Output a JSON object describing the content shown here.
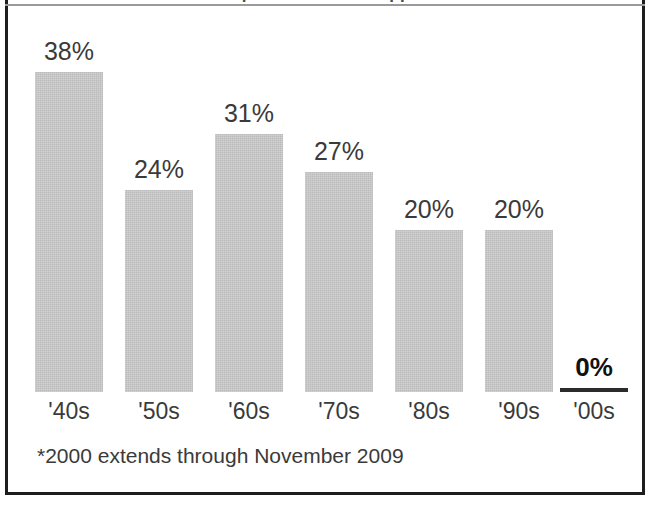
{
  "figure": {
    "title_clipped": "...top of chart title cropped...",
    "footnote": "*2000 extends through November 2009",
    "frame_color": "#1d1d1d",
    "bar_color": "#bcbcbc",
    "label_color": "#3a3a3a"
  },
  "chart_data": {
    "type": "bar",
    "title": "",
    "xlabel": "",
    "ylabel": "",
    "grid": false,
    "legend": "none",
    "ylim": [
      0,
      40
    ],
    "categories": [
      "'40s",
      "'50s",
      "'60s",
      "'70s",
      "'80s",
      "'90s",
      "'00s"
    ],
    "values": [
      38,
      24,
      31,
      27,
      20,
      20,
      0
    ],
    "data_labels": [
      "38%",
      "24%",
      "31%",
      "27%",
      "20%",
      "20%",
      "0%"
    ],
    "emphasis_index": 6,
    "annotations": [
      "*2000 extends through November 2009"
    ]
  },
  "bars": [
    {
      "label": "'40s",
      "value_label": "38%",
      "value": 38,
      "left": 35,
      "height": 320,
      "bold": false,
      "zero": false
    },
    {
      "label": "'50s",
      "value_label": "24%",
      "value": 24,
      "left": 125,
      "height": 202,
      "bold": false,
      "zero": false
    },
    {
      "label": "'60s",
      "value_label": "31%",
      "value": 31,
      "left": 215,
      "height": 258,
      "bold": false,
      "zero": false
    },
    {
      "label": "'70s",
      "value_label": "27%",
      "value": 27,
      "left": 305,
      "height": 220,
      "bold": false,
      "zero": false
    },
    {
      "label": "'80s",
      "value_label": "20%",
      "value": 20,
      "left": 395,
      "height": 162,
      "bold": false,
      "zero": false
    },
    {
      "label": "'90s",
      "value_label": "20%",
      "value": 20,
      "left": 485,
      "height": 162,
      "bold": false,
      "zero": false
    },
    {
      "label": "'00s",
      "value_label": "0%",
      "value": 0,
      "left": 560,
      "height": 4,
      "bold": true,
      "zero": true
    }
  ]
}
